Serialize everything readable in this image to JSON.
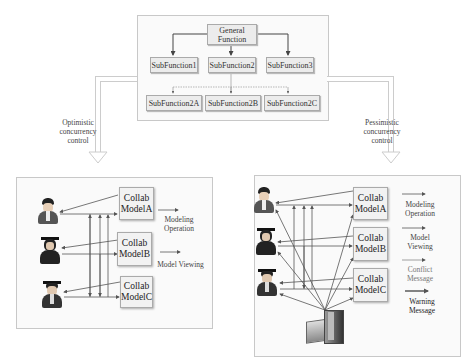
{
  "hierarchy": {
    "root": {
      "label_line1": "General",
      "label_line2": "Function"
    },
    "level1": [
      {
        "label": "SubFunction1"
      },
      {
        "label": "SubFunction2"
      },
      {
        "label": "SubFunction3"
      }
    ],
    "level2": [
      {
        "label": "SubFunction2A"
      },
      {
        "label": "SubFunction2B"
      },
      {
        "label": "SubFunction2C"
      }
    ]
  },
  "transitions": {
    "left": {
      "line1": "Optimistic",
      "line2": "concurrency",
      "line3": "control"
    },
    "right": {
      "line1": "Pessimistic",
      "line2": "concurrency",
      "line3": "control"
    }
  },
  "optimistic_panel": {
    "users": [
      {
        "icon": "user-icon"
      },
      {
        "icon": "graduate-user-icon"
      },
      {
        "icon": "graduate-user-icon"
      }
    ],
    "models": [
      {
        "line1": "Collab",
        "line2": "ModelA"
      },
      {
        "line1": "Collab",
        "line2": "ModelB"
      },
      {
        "line1": "Collab",
        "line2": "ModelC"
      }
    ],
    "legend": [
      {
        "line1": "Modeling",
        "line2": "Operation"
      },
      {
        "line1": "Model Viewing",
        "line2": ""
      }
    ]
  },
  "pessimistic_panel": {
    "users": [
      {
        "icon": "user-icon"
      },
      {
        "icon": "graduate-user-icon"
      },
      {
        "icon": "graduate-user-icon"
      }
    ],
    "models": [
      {
        "line1": "Collab",
        "line2": "ModelA"
      },
      {
        "line1": "Collab",
        "line2": "ModelB"
      },
      {
        "line1": "Collab",
        "line2": "ModelC"
      }
    ],
    "server": {
      "icon": "server-icon"
    },
    "legend": [
      {
        "line1": "Modeling",
        "line2": "Operation"
      },
      {
        "line1": "Model",
        "line2": "Viewing"
      },
      {
        "line1": "Conflict",
        "line2": "Message"
      },
      {
        "line1": "Warning",
        "line2": "Message"
      }
    ]
  },
  "colors": {
    "line": "#555555",
    "panel_border": "#c8c8c8",
    "box_fill": "#ececec"
  }
}
